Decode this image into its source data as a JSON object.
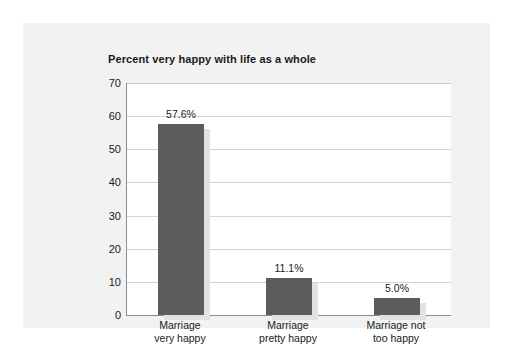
{
  "chart_data": {
    "type": "bar",
    "title": "Percent very happy with life as a whole",
    "xlabel": "",
    "ylabel": "",
    "ylim": [
      0,
      70
    ],
    "yticks": [
      0,
      10,
      20,
      30,
      40,
      50,
      60,
      70
    ],
    "grid": true,
    "legend": false,
    "categories": [
      "Marriage very happy",
      "Marriage pretty happy",
      "Marriage not too happy"
    ],
    "category_lines": [
      [
        "Marriage",
        "very happy"
      ],
      [
        "Marriage",
        "pretty happy"
      ],
      [
        "Marriage not",
        "too happy"
      ]
    ],
    "values": [
      57.6,
      11.1,
      5.0
    ],
    "data_labels": [
      "57.6%",
      "11.1%",
      "5.0%"
    ],
    "bar_color": "#5c5c5c",
    "bar_shadow_color": "#e2e2e2",
    "plot_background": "#ffffff",
    "panel_background": "#f2f2f2",
    "gridline_color": "#d4d4d4",
    "axis_color": "#8c8c8c",
    "text_color": "#1a1a1a"
  }
}
